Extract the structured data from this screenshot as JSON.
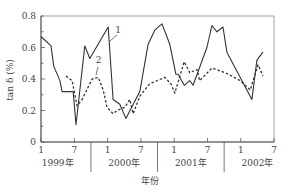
{
  "chart_data": {
    "type": "line",
    "title": "",
    "xlabel": "年份",
    "ylabel": "tan δ (%)",
    "ylim": [
      0,
      0.8
    ],
    "yticks": [
      0,
      0.2,
      0.4,
      0.6,
      0.8
    ],
    "ytick_labels": [
      "0",
      "0.2",
      "0.4",
      "0.6",
      "0.8"
    ],
    "x_unit": "month index from Jan 1999 (0 = 1999-1)",
    "xlim": [
      0,
      42
    ],
    "xticks": [
      0,
      6,
      12,
      18,
      24,
      30,
      36,
      42
    ],
    "xtick_labels": [
      "1",
      "7",
      "1",
      "7",
      "1",
      "7",
      "1",
      "7"
    ],
    "year_groups": [
      {
        "label": "1999年",
        "center": 3
      },
      {
        "label": "2000年",
        "center": 15
      },
      {
        "label": "2001年",
        "center": 27
      },
      {
        "label": "2002年",
        "center": 39
      }
    ],
    "year_separators": [
      9,
      21,
      33
    ],
    "grid": false,
    "series": [
      {
        "name": "1",
        "style": "solid",
        "x": [
          0,
          1.8,
          2.3,
          3.4,
          3.8,
          5.8,
          6.3,
          7.9,
          8.8,
          12.1,
          13.0,
          14.2,
          15.3,
          17.8,
          19.3,
          20.5,
          21.8,
          23.2,
          24.3,
          24.7,
          25.8,
          26.8,
          27.4,
          29.9,
          30.8,
          31.7,
          32.8,
          33.5,
          38.0,
          38.9,
          40.0
        ],
        "values": [
          0.67,
          0.61,
          0.48,
          0.39,
          0.32,
          0.32,
          0.11,
          0.61,
          0.53,
          0.73,
          0.27,
          0.24,
          0.15,
          0.32,
          0.62,
          0.71,
          0.75,
          0.62,
          0.43,
          0.43,
          0.36,
          0.39,
          0.36,
          0.6,
          0.74,
          0.7,
          0.73,
          0.57,
          0.27,
          0.52,
          0.57
        ]
      },
      {
        "name": "2",
        "style": "dashed",
        "x": [
          4.5,
          5.6,
          6.5,
          7.4,
          9.2,
          10.3,
          11.2,
          11.9,
          13.0,
          13.7,
          15.1,
          16.0,
          16.6,
          17.8,
          19.6,
          22.3,
          23.4,
          24.1,
          25.8,
          26.8,
          28.1,
          28.6,
          30.8,
          33.2,
          35.9,
          37.7,
          39.1,
          40.0
        ],
        "values": [
          0.42,
          0.39,
          0.23,
          0.27,
          0.4,
          0.41,
          0.33,
          0.22,
          0.18,
          0.2,
          0.22,
          0.27,
          0.18,
          0.29,
          0.37,
          0.41,
          0.37,
          0.31,
          0.51,
          0.44,
          0.46,
          0.39,
          0.47,
          0.44,
          0.39,
          0.33,
          0.49,
          0.42
        ]
      }
    ],
    "annotations": [
      {
        "text": "1",
        "series": "1",
        "x": 13.9,
        "y": 0.69
      },
      {
        "text": "2",
        "series": "2",
        "x": 10.4,
        "y": 0.5
      }
    ]
  },
  "colors": {
    "line": "#333333",
    "axis": "#555555",
    "frame": "#888888",
    "text": "#444444"
  }
}
